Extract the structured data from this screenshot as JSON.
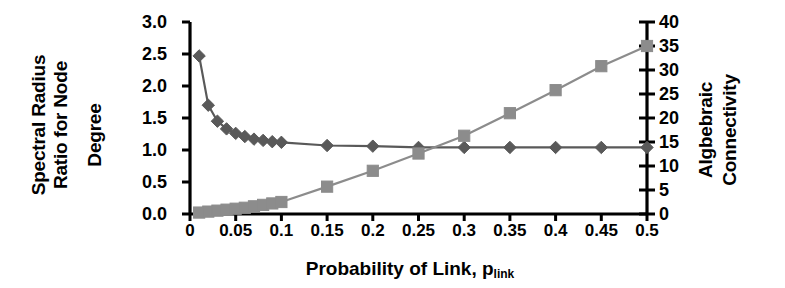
{
  "chart_data": {
    "type": "line",
    "title": "",
    "xlabel": "Probability of Link, p",
    "xlabel_sub": "link",
    "ylabel_left": "Spectral Radius Ratio for Node Degree",
    "ylabel_left_lines": [
      "Spectral Radius",
      "Ratio for Node",
      "Degree"
    ],
    "ylabel_right": "Algbebraic Connectivity",
    "ylabel_right_lines": [
      "Algbebraic",
      "Connectivity"
    ],
    "xlim": [
      0,
      0.5
    ],
    "ylim_left": [
      0.0,
      3.0
    ],
    "ylim_right": [
      0,
      40
    ],
    "xticks": [
      "0",
      "0.05",
      "0.1",
      "0.15",
      "0.2",
      "0.25",
      "0.3",
      "0.35",
      "0.4",
      "0.45",
      "0.5"
    ],
    "xtick_values": [
      0,
      0.05,
      0.1,
      0.15,
      0.2,
      0.25,
      0.3,
      0.35,
      0.4,
      0.45,
      0.5
    ],
    "yticks_left": [
      "0.0",
      "0.5",
      "1.0",
      "1.5",
      "2.0",
      "2.5",
      "3.0"
    ],
    "ytick_left_values": [
      0.0,
      0.5,
      1.0,
      1.5,
      2.0,
      2.5,
      3.0
    ],
    "yticks_right": [
      "0",
      "5",
      "10",
      "15",
      "20",
      "25",
      "30",
      "35",
      "40"
    ],
    "ytick_right_values": [
      0,
      5,
      10,
      15,
      20,
      25,
      30,
      35,
      40
    ],
    "grid": false,
    "legend": "none",
    "series": [
      {
        "name": "Spectral Radius Ratio for Node Degree",
        "axis": "left",
        "marker": "diamond",
        "color": "#595959",
        "x": [
          0.01,
          0.02,
          0.03,
          0.04,
          0.05,
          0.06,
          0.07,
          0.08,
          0.09,
          0.1,
          0.15,
          0.2,
          0.25,
          0.3,
          0.35,
          0.4,
          0.45,
          0.5
        ],
        "values": [
          2.47,
          1.7,
          1.45,
          1.33,
          1.26,
          1.21,
          1.17,
          1.15,
          1.13,
          1.12,
          1.07,
          1.06,
          1.04,
          1.04,
          1.04,
          1.04,
          1.04,
          1.04
        ]
      },
      {
        "name": "Algbebraic Connectivity",
        "axis": "right",
        "marker": "square",
        "color": "#8c8c8c",
        "x": [
          0.01,
          0.02,
          0.03,
          0.04,
          0.05,
          0.06,
          0.07,
          0.08,
          0.09,
          0.1,
          0.15,
          0.2,
          0.25,
          0.3,
          0.35,
          0.4,
          0.45,
          0.5
        ],
        "values": [
          0.3,
          0.5,
          0.7,
          0.9,
          1.1,
          1.3,
          1.6,
          1.9,
          2.2,
          2.5,
          5.7,
          9.0,
          12.6,
          16.3,
          21.0,
          25.8,
          30.8,
          35.0
        ]
      }
    ]
  },
  "geometry": {
    "plot_left": 190,
    "plot_right": 647,
    "plot_top": 22,
    "plot_bottom": 214,
    "axis_color": "#000000",
    "line_color_left": "#595959",
    "line_color_right": "#8c8c8c",
    "background": "#ffffff"
  }
}
